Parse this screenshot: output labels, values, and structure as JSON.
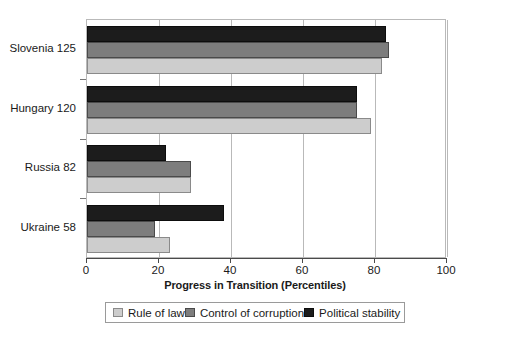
{
  "chart_data": {
    "type": "bar",
    "orientation": "horizontal",
    "title": "",
    "xlabel": "Progress in Transition (Percentiles)",
    "ylabel": "",
    "xlim": [
      0,
      100
    ],
    "xticks": [
      0,
      20,
      40,
      60,
      80,
      100
    ],
    "xtick_labels": [
      "0",
      "20",
      "40",
      "60",
      "80",
      "100"
    ],
    "grid": true,
    "grid_axis": "x",
    "legend_position": "bottom",
    "categories": [
      "Slovenia 125",
      "Hungary 120",
      "Russia 82",
      "Ukraine 58"
    ],
    "series": [
      {
        "name": "Rule of law",
        "color": "#cdcdcd",
        "values": [
          82,
          79,
          29,
          23
        ]
      },
      {
        "name": "Control of corruption",
        "color": "#7d7d7d",
        "values": [
          84,
          75,
          29,
          19
        ]
      },
      {
        "name": "Political stability",
        "color": "#1c1c1c",
        "values": [
          83,
          75,
          22,
          38
        ]
      }
    ],
    "series_draw_order_top_to_bottom": [
      "Political stability",
      "Control of corruption",
      "Rule of law"
    ]
  },
  "legend": {
    "items": [
      {
        "label": "Rule of law",
        "swatch": "rule"
      },
      {
        "label": "Control of corruption",
        "swatch": "corruption"
      },
      {
        "label": "Political stability",
        "swatch": "political"
      }
    ]
  },
  "axis": {
    "x_title": "Progress in Transition (Percentiles)"
  }
}
